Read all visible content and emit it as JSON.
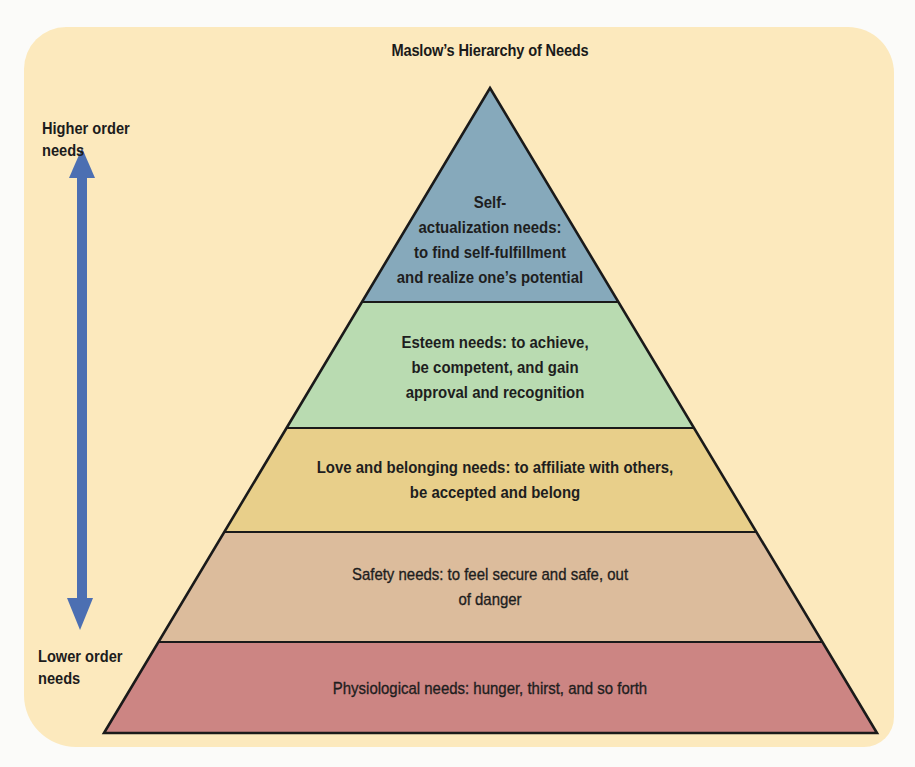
{
  "diagram": {
    "title": "Maslow’s Hierarchy of Needs",
    "axis": {
      "top_label_line1": "Higher order",
      "top_label_line2": "needs",
      "bottom_label_line1": "Lower order",
      "bottom_label_line2": "needs",
      "arrow_color": "#4c6fb2",
      "arrow_semantic": "double-headed-vertical-arrow-icon"
    },
    "colors": {
      "background": "#fce9bd",
      "outline": "#1a1a1a"
    },
    "tiers": [
      {
        "name": "self-actualization",
        "color": "#86a9bb",
        "lines": [
          "Self-",
          "actualization needs:",
          "to find self-fulfillment",
          "and realize one’s potential"
        ]
      },
      {
        "name": "esteem",
        "color": "#b9dbb1",
        "lines": [
          "Esteem needs: to achieve,",
          "be competent, and gain",
          "approval and recognition"
        ]
      },
      {
        "name": "love-belonging",
        "color": "#e8cf8a",
        "lines": [
          "Love and belonging needs: to affiliate with others,",
          "be accepted and belong"
        ]
      },
      {
        "name": "safety",
        "color": "#dcbc9c",
        "lines": [
          "Safety needs: to feel secure and safe, out",
          "of danger"
        ]
      },
      {
        "name": "physiological",
        "color": "#cc8583",
        "lines": [
          "Physiological needs: hunger, thirst, and so forth"
        ]
      }
    ]
  }
}
